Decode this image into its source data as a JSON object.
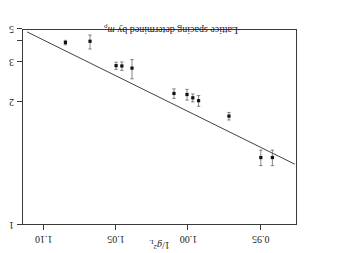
{
  "figure": {
    "orientation_note": "rotated-180",
    "background_color": "#ffffff",
    "ink_color": "#1a1a1a",
    "frame_color": "#3a3a3a"
  },
  "annotation": {
    "prefix": "Lattice spacing determined by ",
    "symbol": "m",
    "symbol_sub": "ρ"
  },
  "x_axis": {
    "title_prefix": "1/",
    "title_symbol": "g",
    "title_sup": "2",
    "title_sub": "L",
    "tick_labels": [
      "0.95",
      "1.00",
      "1.05",
      "1.10"
    ]
  },
  "y_axis": {
    "title_prefix": "1/",
    "title_symbol": "a",
    "title_suffix": " (GeV)",
    "tick_labels": [
      "1",
      "2",
      "3",
      "",
      "5"
    ]
  },
  "chart_data": {
    "type": "scatter",
    "title": "",
    "subtitle": "",
    "xlabel": "1/g^2_L",
    "ylabel": "1/a (GeV)",
    "xlim": [
      0.925,
      1.115
    ],
    "ylim_inverse_axis": [
      1,
      5
    ],
    "y_tick_values": [
      1,
      2,
      3,
      4,
      5
    ],
    "x_tick_values": [
      0.95,
      1.0,
      1.05,
      1.1
    ],
    "grid": false,
    "legend": null,
    "annotations": [
      {
        "text": "Lattice spacing determined by m_rho",
        "x": 1.012,
        "y": 4.35
      }
    ],
    "series": [
      {
        "name": "lattice spacing data",
        "marker": "filled-square",
        "marker_color": "#111111",
        "errorbar_color": "#555555",
        "x": [
          0.942,
          0.95,
          0.972,
          0.993,
          0.997,
          1.001,
          1.01,
          1.039,
          1.046,
          1.05,
          1.068,
          1.085
        ],
        "y": [
          1.38,
          1.38,
          1.8,
          2.03,
          2.08,
          2.14,
          2.16,
          2.78,
          2.85,
          2.86,
          4.0,
          3.92
        ],
        "yerr_low": [
          0.06,
          0.06,
          0.05,
          0.09,
          0.07,
          0.1,
          0.09,
          0.3,
          0.14,
          0.12,
          0.45,
          0.14
        ],
        "yerr_high": [
          0.06,
          0.06,
          0.05,
          0.09,
          0.07,
          0.1,
          0.09,
          0.3,
          0.14,
          0.12,
          0.45,
          0.14
        ]
      }
    ],
    "fit_line": {
      "name": "linear fit",
      "color": "#2b2b2b",
      "x_start": 0.9265,
      "x_end": 1.1115,
      "y_start": 1.33,
      "y_end": 4.72
    }
  }
}
